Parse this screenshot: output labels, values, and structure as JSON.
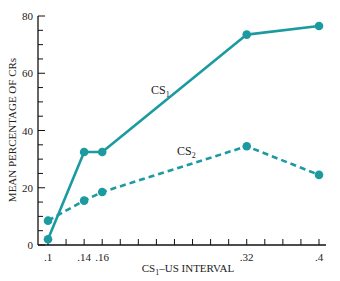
{
  "chart_data": {
    "type": "line",
    "title": "",
    "xlabel": "CS",
    "xlabel_sub": "1",
    "xlabel_rest": "–US INTERVAL",
    "ylabel": "MEAN PERCENTAGE OF CRs",
    "xlim": [
      0.088,
      0.42
    ],
    "ylim": [
      0,
      80
    ],
    "x_ticks": [
      0.1,
      0.14,
      0.16,
      0.32,
      0.4
    ],
    "x_tick_labels": [
      ".1",
      ".14",
      ".16",
      ".32",
      ".4"
    ],
    "x_minor_step": 0.02,
    "y_ticks": [
      0,
      20,
      40,
      60,
      80
    ],
    "y_tick_labels": [
      "0",
      "20",
      "40",
      "60",
      "80"
    ],
    "y_minor_step": 5,
    "grid": false,
    "color": "#1b9aa0",
    "series": [
      {
        "name": "CS1",
        "label_main": "CS",
        "label_sub": "1",
        "style": "solid",
        "x": [
          0.1,
          0.14,
          0.16,
          0.32,
          0.4
        ],
        "values": [
          2,
          32.5,
          32.5,
          73.5,
          76.5
        ]
      },
      {
        "name": "CS2",
        "label_main": "CS",
        "label_sub": "2",
        "style": "dashed",
        "x": [
          0.1,
          0.14,
          0.16,
          0.32,
          0.4
        ],
        "values": [
          8.5,
          15.5,
          18.5,
          34.5,
          24.5
        ]
      }
    ]
  }
}
